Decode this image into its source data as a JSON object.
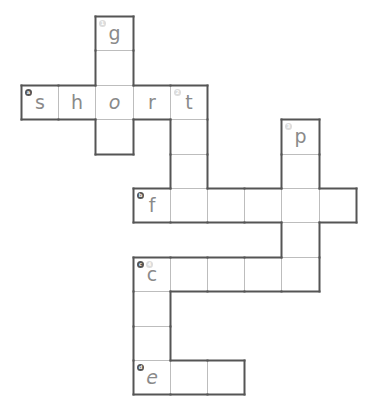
{
  "puzzle": {
    "type": "crossword",
    "grid": {
      "origin_x": 21,
      "origin_y": 16,
      "col_width": 37.2,
      "row_height": 34.4,
      "line_color": "#bdbdbd",
      "outline_color": "#555555",
      "letter_color": "#8a8a8a"
    },
    "cells": [
      {
        "row": 0,
        "col": 2,
        "letter": "g",
        "badges": [
          {
            "label": "1",
            "kind": "down"
          }
        ]
      },
      {
        "row": 1,
        "col": 2,
        "letter": ""
      },
      {
        "row": 2,
        "col": 0,
        "letter": "s",
        "badges": [
          {
            "label": "a",
            "kind": "across"
          }
        ]
      },
      {
        "row": 2,
        "col": 1,
        "letter": "h"
      },
      {
        "row": 2,
        "col": 2,
        "letter": "o",
        "italic": true
      },
      {
        "row": 2,
        "col": 3,
        "letter": "r"
      },
      {
        "row": 2,
        "col": 4,
        "letter": "t",
        "badges": [
          {
            "label": "2",
            "kind": "down"
          }
        ]
      },
      {
        "row": 3,
        "col": 2,
        "letter": ""
      },
      {
        "row": 3,
        "col": 4,
        "letter": ""
      },
      {
        "row": 3,
        "col": 7,
        "letter": "p",
        "badges": [
          {
            "label": "3",
            "kind": "down"
          }
        ]
      },
      {
        "row": 4,
        "col": 4,
        "letter": ""
      },
      {
        "row": 4,
        "col": 7,
        "letter": ""
      },
      {
        "row": 5,
        "col": 3,
        "letter": "f",
        "badges": [
          {
            "label": "b",
            "kind": "across"
          }
        ]
      },
      {
        "row": 5,
        "col": 4,
        "letter": ""
      },
      {
        "row": 5,
        "col": 5,
        "letter": ""
      },
      {
        "row": 5,
        "col": 6,
        "letter": ""
      },
      {
        "row": 5,
        "col": 7,
        "letter": ""
      },
      {
        "row": 5,
        "col": 8,
        "letter": ""
      },
      {
        "row": 6,
        "col": 7,
        "letter": ""
      },
      {
        "row": 7,
        "col": 3,
        "letter": "c",
        "badges": [
          {
            "label": "c",
            "kind": "across"
          },
          {
            "label": "4",
            "kind": "down"
          }
        ]
      },
      {
        "row": 7,
        "col": 4,
        "letter": ""
      },
      {
        "row": 7,
        "col": 5,
        "letter": ""
      },
      {
        "row": 7,
        "col": 6,
        "letter": ""
      },
      {
        "row": 7,
        "col": 7,
        "letter": ""
      },
      {
        "row": 8,
        "col": 3,
        "letter": ""
      },
      {
        "row": 9,
        "col": 3,
        "letter": ""
      },
      {
        "row": 10,
        "col": 3,
        "letter": "e",
        "italic": true,
        "badges": [
          {
            "label": "d",
            "kind": "across"
          }
        ]
      },
      {
        "row": 10,
        "col": 4,
        "letter": ""
      },
      {
        "row": 10,
        "col": 5,
        "letter": ""
      }
    ],
    "words": [
      {
        "id": "a",
        "direction": "across",
        "row": 2,
        "col": 0,
        "length": 5,
        "visible": "short"
      },
      {
        "id": "b",
        "direction": "across",
        "row": 5,
        "col": 3,
        "length": 6,
        "visible": "f"
      },
      {
        "id": "c",
        "direction": "across",
        "row": 7,
        "col": 3,
        "length": 5,
        "visible": "c"
      },
      {
        "id": "d",
        "direction": "across",
        "row": 10,
        "col": 3,
        "length": 3,
        "visible": "e"
      },
      {
        "id": "1",
        "direction": "down",
        "row": 0,
        "col": 2,
        "length": 4,
        "visible": "g_o_"
      },
      {
        "id": "2",
        "direction": "down",
        "row": 2,
        "col": 4,
        "length": 4,
        "visible": "t"
      },
      {
        "id": "3",
        "direction": "down",
        "row": 3,
        "col": 7,
        "length": 5,
        "visible": "p"
      },
      {
        "id": "4",
        "direction": "down",
        "row": 7,
        "col": 3,
        "length": 4,
        "visible": "c"
      }
    ]
  }
}
